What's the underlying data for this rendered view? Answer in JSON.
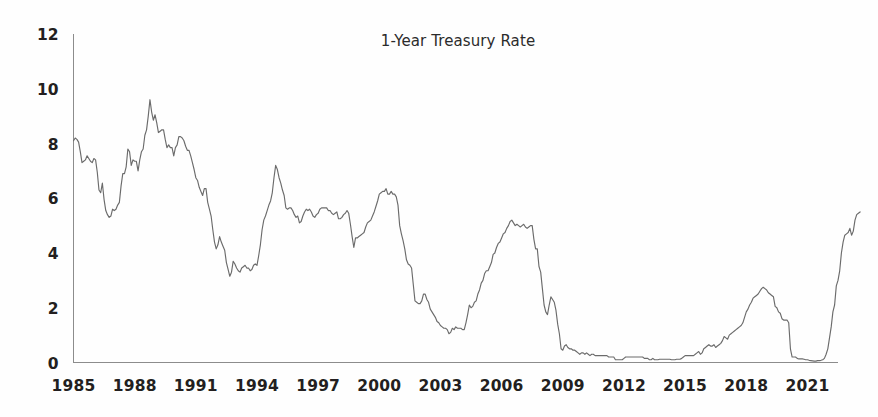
{
  "chart_data": {
    "type": "line",
    "title": "1-Year Treasury Rate",
    "xlabel": "",
    "ylabel": "",
    "xlim": [
      1985.0,
      2022.5
    ],
    "ylim": [
      0,
      12
    ],
    "grid": false,
    "legend": "none",
    "y_ticks": [
      0,
      2,
      4,
      6,
      8,
      10,
      12
    ],
    "y_tick_labels": [
      "0",
      "2",
      "4",
      "6",
      "8",
      "10",
      "12"
    ],
    "x_ticks": [
      1985,
      1988,
      1991,
      1994,
      1997,
      2000,
      2003,
      2006,
      2009,
      2012,
      2015,
      2018,
      2021
    ],
    "x_tick_labels": [
      "1985",
      "1988",
      "1991",
      "1994",
      "1997",
      "2000",
      "2003",
      "2006",
      "2009",
      "2012",
      "2015",
      "2018",
      "2021"
    ],
    "line_color": "#6b6b6b",
    "axis_color": "#8c8c8c",
    "background_color": "#fefefe",
    "series": [
      {
        "name": "1-Year Treasury Rate",
        "units": "percent",
        "frequency": "monthly",
        "x_start": 1985.0,
        "x_step": 0.0833333,
        "values": [
          8.1,
          8.2,
          8.15,
          8.05,
          7.7,
          7.3,
          7.35,
          7.4,
          7.55,
          7.45,
          7.35,
          7.3,
          7.45,
          7.4,
          6.95,
          6.3,
          6.2,
          6.55,
          5.95,
          5.55,
          5.4,
          5.3,
          5.35,
          5.6,
          5.55,
          5.6,
          5.75,
          5.85,
          6.45,
          6.9,
          6.9,
          7.15,
          7.8,
          7.7,
          7.2,
          7.4,
          7.35,
          7.35,
          7.0,
          7.4,
          7.7,
          7.8,
          8.3,
          8.5,
          9.0,
          9.6,
          9.15,
          8.85,
          9.05,
          8.75,
          8.4,
          8.45,
          8.5,
          8.5,
          8.15,
          7.85,
          7.95,
          7.85,
          7.85,
          7.55,
          7.85,
          7.95,
          8.25,
          8.25,
          8.2,
          8.1,
          7.9,
          7.75,
          7.75,
          7.55,
          7.3,
          7.05,
          6.75,
          6.65,
          6.4,
          6.25,
          6.1,
          6.35,
          6.35,
          5.85,
          5.6,
          5.35,
          4.85,
          4.4,
          4.15,
          4.3,
          4.6,
          4.4,
          4.25,
          4.1,
          3.65,
          3.4,
          3.15,
          3.3,
          3.7,
          3.6,
          3.45,
          3.35,
          3.3,
          3.45,
          3.5,
          3.55,
          3.45,
          3.45,
          3.35,
          3.4,
          3.55,
          3.6,
          3.55,
          3.9,
          4.3,
          4.85,
          5.2,
          5.35,
          5.55,
          5.75,
          5.9,
          6.2,
          6.75,
          7.2,
          7.05,
          6.75,
          6.55,
          6.3,
          6.1,
          5.65,
          5.6,
          5.65,
          5.65,
          5.55,
          5.4,
          5.3,
          5.35,
          5.1,
          5.15,
          5.35,
          5.5,
          5.6,
          5.55,
          5.6,
          5.5,
          5.35,
          5.3,
          5.4,
          5.45,
          5.6,
          5.65,
          5.65,
          5.65,
          5.65,
          5.55,
          5.55,
          5.45,
          5.4,
          5.45,
          5.5,
          5.25,
          5.25,
          5.3,
          5.4,
          5.45,
          5.55,
          5.45,
          5.05,
          4.6,
          4.2,
          4.55,
          4.55,
          4.6,
          4.65,
          4.7,
          4.75,
          4.95,
          5.1,
          5.15,
          5.2,
          5.35,
          5.5,
          5.7,
          5.9,
          6.15,
          6.2,
          6.25,
          6.25,
          6.35,
          6.15,
          6.15,
          6.25,
          6.15,
          6.15,
          6.05,
          5.75,
          5.0,
          4.7,
          4.45,
          4.15,
          3.75,
          3.6,
          3.55,
          3.45,
          2.85,
          2.25,
          2.2,
          2.15,
          2.15,
          2.25,
          2.5,
          2.5,
          2.3,
          2.2,
          1.95,
          1.85,
          1.75,
          1.65,
          1.5,
          1.45,
          1.35,
          1.3,
          1.25,
          1.25,
          1.2,
          1.05,
          1.1,
          1.25,
          1.2,
          1.3,
          1.25,
          1.25,
          1.25,
          1.2,
          1.2,
          1.45,
          1.75,
          2.1,
          2.0,
          2.05,
          2.2,
          2.25,
          2.5,
          2.65,
          2.9,
          3.0,
          3.25,
          3.35,
          3.35,
          3.5,
          3.65,
          3.95,
          4.0,
          4.2,
          4.35,
          4.4,
          4.55,
          4.7,
          4.75,
          4.9,
          5.0,
          5.15,
          5.2,
          5.1,
          5.0,
          5.05,
          5.0,
          4.95,
          5.0,
          5.05,
          4.95,
          4.9,
          4.95,
          5.0,
          5.0,
          4.5,
          4.15,
          4.15,
          3.5,
          3.3,
          2.7,
          2.1,
          1.85,
          1.75,
          2.1,
          2.4,
          2.3,
          2.2,
          1.9,
          1.4,
          1.05,
          0.5,
          0.45,
          0.6,
          0.65,
          0.55,
          0.5,
          0.5,
          0.45,
          0.45,
          0.4,
          0.35,
          0.3,
          0.35,
          0.35,
          0.3,
          0.35,
          0.3,
          0.25,
          0.3,
          0.3,
          0.25,
          0.25,
          0.25,
          0.25,
          0.25,
          0.25,
          0.25,
          0.25,
          0.2,
          0.2,
          0.2,
          0.2,
          0.1,
          0.1,
          0.1,
          0.1,
          0.1,
          0.15,
          0.2,
          0.2,
          0.2,
          0.2,
          0.2,
          0.2,
          0.2,
          0.2,
          0.2,
          0.2,
          0.2,
          0.15,
          0.15,
          0.15,
          0.1,
          0.1,
          0.15,
          0.1,
          0.1,
          0.1,
          0.12,
          0.12,
          0.12,
          0.12,
          0.12,
          0.12,
          0.12,
          0.1,
          0.1,
          0.1,
          0.12,
          0.12,
          0.12,
          0.15,
          0.2,
          0.25,
          0.25,
          0.25,
          0.25,
          0.25,
          0.25,
          0.3,
          0.35,
          0.4,
          0.3,
          0.35,
          0.5,
          0.55,
          0.6,
          0.65,
          0.6,
          0.6,
          0.65,
          0.55,
          0.6,
          0.65,
          0.7,
          0.8,
          0.95,
          0.9,
          0.85,
          1.0,
          1.05,
          1.1,
          1.15,
          1.2,
          1.25,
          1.3,
          1.35,
          1.45,
          1.65,
          1.85,
          1.95,
          2.1,
          2.2,
          2.35,
          2.4,
          2.45,
          2.5,
          2.6,
          2.7,
          2.75,
          2.7,
          2.65,
          2.55,
          2.5,
          2.45,
          2.4,
          2.05,
          2.0,
          1.85,
          1.8,
          1.6,
          1.55,
          1.55,
          1.55,
          1.45,
          0.5,
          0.2,
          0.2,
          0.2,
          0.15,
          0.13,
          0.13,
          0.13,
          0.12,
          0.1,
          0.1,
          0.08,
          0.07,
          0.06,
          0.05,
          0.05,
          0.07,
          0.07,
          0.08,
          0.1,
          0.15,
          0.3,
          0.5,
          0.9,
          1.3,
          1.85,
          2.1,
          2.8,
          3.0,
          3.35,
          4.0,
          4.4,
          4.65,
          4.7,
          4.75,
          4.9,
          4.65,
          4.8,
          5.2,
          5.4,
          5.45,
          5.5
        ]
      }
    ]
  }
}
